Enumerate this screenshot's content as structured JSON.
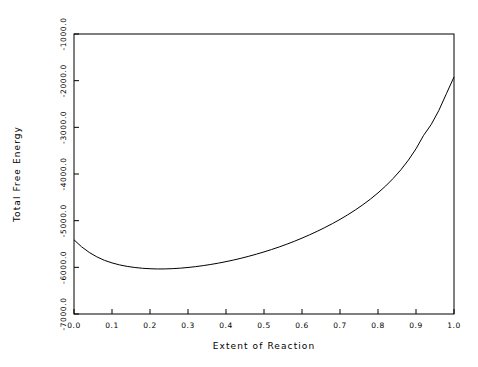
{
  "chart_data": {
    "type": "line",
    "title": "",
    "xlabel": "Extent of Reaction",
    "ylabel": "Total Free Energy",
    "xlim": [
      0.0,
      1.0
    ],
    "ylim": [
      -7000.0,
      -1000.0
    ],
    "grid": false,
    "legend": null,
    "xticks": [
      0.0,
      0.1,
      0.2,
      0.3,
      0.4,
      0.5,
      0.6,
      0.7,
      0.8,
      0.9,
      1.0
    ],
    "xticklabels": [
      "0.0",
      "0.1",
      "0.2",
      "0.3",
      "0.4",
      "0.5",
      "0.6",
      "0.7",
      "0.8",
      "0.9",
      "1.0"
    ],
    "yticks": [
      -7000.0,
      -6000.0,
      -5000.0,
      -4000.0,
      -3000.0,
      -2000.0,
      -1000.0
    ],
    "yticklabels": [
      "-7000.0",
      "-6000.0",
      "-5000.0",
      "-4000.0",
      "-3000.0",
      "-2000.0",
      "-1000.0"
    ],
    "series": [
      {
        "name": "Total Free Energy",
        "color": "#000000",
        "x": [
          0.0,
          0.02,
          0.04,
          0.06,
          0.08,
          0.1,
          0.12,
          0.14,
          0.16,
          0.18,
          0.2,
          0.22,
          0.24,
          0.26,
          0.28,
          0.3,
          0.32,
          0.34,
          0.36,
          0.38,
          0.4,
          0.42,
          0.44,
          0.46,
          0.48,
          0.5,
          0.52,
          0.54,
          0.56,
          0.58,
          0.6,
          0.62,
          0.64,
          0.66,
          0.68,
          0.7,
          0.72,
          0.74,
          0.76,
          0.78,
          0.8,
          0.82,
          0.84,
          0.86,
          0.88,
          0.9,
          0.92,
          0.94,
          0.96,
          0.98,
          1.0
        ],
        "y": [
          -5410,
          -5560,
          -5680,
          -5775,
          -5850,
          -5905,
          -5948,
          -5980,
          -6003,
          -6020,
          -6030,
          -6035,
          -6034,
          -6028,
          -6018,
          -6003,
          -5985,
          -5963,
          -5938,
          -5910,
          -5878,
          -5843,
          -5805,
          -5763,
          -5718,
          -5670,
          -5618,
          -5563,
          -5504,
          -5441,
          -5374,
          -5303,
          -5228,
          -5148,
          -5063,
          -4973,
          -4876,
          -4772,
          -4660,
          -4538,
          -4405,
          -4258,
          -4095,
          -3912,
          -3703,
          -3460,
          -3172,
          -2940,
          -2640,
          -2280,
          -1921
        ]
      }
    ],
    "minimum": {
      "x": 0.22,
      "y": -6035
    },
    "endpoints": {
      "start": {
        "x": 0.0,
        "y": -5410
      },
      "end": {
        "x": 1.0,
        "y": -1921
      }
    }
  },
  "figure": {
    "background_color": "#ffffff",
    "axis_color": "#000000",
    "line_color": "#000000"
  }
}
